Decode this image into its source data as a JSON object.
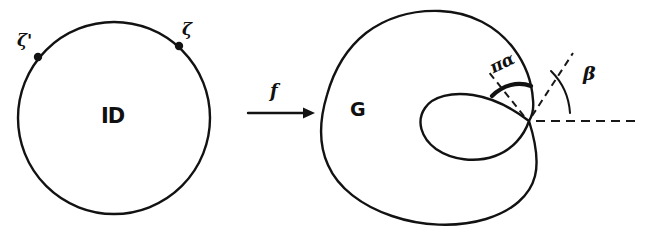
{
  "figure": {
    "width": 646,
    "height": 234,
    "background": "#ffffff",
    "ink_color": "#121212"
  },
  "left_panel": {
    "name": "unit-disk",
    "region_label": "D̵",
    "region_label_text": "ID",
    "circle": {
      "cx": 114,
      "cy": 118,
      "r": 96
    },
    "boundary_points": [
      {
        "id": "zeta-prime",
        "label": "ζ'",
        "dot_x": 38,
        "dot_y": 57,
        "label_x": 17,
        "label_y": 36
      },
      {
        "id": "zeta",
        "label": "ζ",
        "dot_x": 179,
        "dot_y": 46,
        "label_x": 183,
        "label_y": 25
      }
    ]
  },
  "arrow": {
    "name": "map-arrow",
    "label": "f",
    "label_x": 272,
    "label_y": 86,
    "x1": 248,
    "x2": 312,
    "y": 113
  },
  "right_panel": {
    "name": "image-region",
    "region_label": "G",
    "region_label_x": 352,
    "region_label_y": 109,
    "cusp_point": {
      "x": 529,
      "y": 121
    },
    "annotations": [
      {
        "id": "cusp-opening",
        "label": "πα",
        "label_x": 486,
        "label_y": 60,
        "rotation_deg": -26,
        "meaning": "interior opening angle at the cusp"
      },
      {
        "id": "inclination",
        "label": "β",
        "label_x": 583,
        "label_y": 71,
        "rotation_deg": 0,
        "meaning": "angle between horizontal dashed axis and the dashed tangent ray"
      }
    ],
    "dashed_lines": [
      {
        "id": "horizontal-axis",
        "x1": 534,
        "y1": 121,
        "x2": 640,
        "y2": 121
      },
      {
        "id": "tangent-ray",
        "x1": 531,
        "y1": 118,
        "x2": 572,
        "y2": 55
      },
      {
        "id": "cusp-side-ray",
        "x1": 524,
        "y1": 117,
        "x2": 489,
        "y2": 73
      }
    ]
  }
}
